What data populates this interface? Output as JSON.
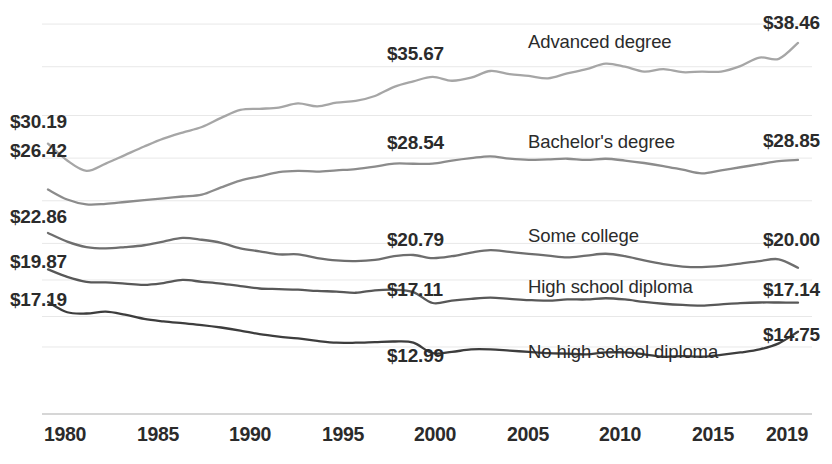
{
  "chart_data": {
    "type": "line",
    "title": "",
    "subtitle": "",
    "xlabel": "",
    "ylabel": "",
    "grid": true,
    "legend_position": "inline-on-series",
    "x": [
      1980,
      1981,
      1982,
      1983,
      1984,
      1985,
      1986,
      1987,
      1988,
      1989,
      1990,
      1991,
      1992,
      1993,
      1994,
      1995,
      1996,
      1997,
      1998,
      1999,
      2000,
      2001,
      2002,
      2003,
      2004,
      2005,
      2006,
      2007,
      2008,
      2009,
      2010,
      2011,
      2012,
      2013,
      2014,
      2015,
      2016,
      2017,
      2018,
      2019
    ],
    "xlim": [
      1980,
      2019
    ],
    "ylim": [
      8.0,
      40.5
    ],
    "xticks": [
      1980,
      1985,
      1990,
      1995,
      2000,
      2005,
      2010,
      2015,
      2019
    ],
    "xtick_labels": [
      "1980",
      "1985",
      "1990",
      "1995",
      "2000",
      "2005",
      "2010",
      "2015",
      "2019"
    ],
    "ygridlines": [
      40.0,
      36.5,
      32.5,
      29.0,
      25.5,
      22.0,
      19.0,
      16.0,
      13.5
    ],
    "series": [
      {
        "name": "Advanced degree",
        "color": "#a6a6a6",
        "start_label": "$30.19",
        "mid_label": "$35.67",
        "end_label": "$38.46",
        "values": [
          30.19,
          28.8,
          27.95,
          28.55,
          29.25,
          29.95,
          30.6,
          31.1,
          31.55,
          32.3,
          32.95,
          33.05,
          33.15,
          33.5,
          33.25,
          33.55,
          33.7,
          34.1,
          34.85,
          35.3,
          35.67,
          35.35,
          35.6,
          36.15,
          35.9,
          35.75,
          35.55,
          35.95,
          36.3,
          36.75,
          36.5,
          36.1,
          36.3,
          36.05,
          36.1,
          36.1,
          36.55,
          37.25,
          37.15,
          38.46
        ]
      },
      {
        "name": "Bachelor's degree",
        "color": "#8c8c8c",
        "start_label": "$26.42",
        "mid_label": "$28.54",
        "end_label": "$28.85",
        "values": [
          26.42,
          25.6,
          25.2,
          25.25,
          25.4,
          25.55,
          25.7,
          25.85,
          26.0,
          26.6,
          27.15,
          27.5,
          27.85,
          27.95,
          27.9,
          28.0,
          28.1,
          28.3,
          28.55,
          28.54,
          28.55,
          28.8,
          29.0,
          29.15,
          28.95,
          28.85,
          28.9,
          28.95,
          28.85,
          28.95,
          28.8,
          28.6,
          28.35,
          28.05,
          27.75,
          28.0,
          28.25,
          28.5,
          28.75,
          28.85
        ]
      },
      {
        "name": "Some college",
        "color": "#6e6e6e",
        "start_label": "$22.86",
        "mid_label": "$20.79",
        "end_label": "$20.00",
        "values": [
          22.86,
          22.15,
          21.7,
          21.6,
          21.7,
          21.85,
          22.15,
          22.45,
          22.3,
          22.05,
          21.6,
          21.35,
          21.1,
          21.1,
          20.8,
          20.6,
          20.55,
          20.65,
          20.95,
          21.05,
          20.79,
          20.95,
          21.25,
          21.45,
          21.3,
          21.15,
          21.0,
          20.85,
          21.0,
          21.15,
          20.95,
          20.6,
          20.3,
          20.1,
          20.05,
          20.15,
          20.35,
          20.55,
          20.7,
          20.0
        ]
      },
      {
        "name": "High school diploma",
        "color": "#585858",
        "start_label": "$19.87",
        "mid_label": "$17.11",
        "end_label": "$17.14",
        "values": [
          19.87,
          19.25,
          18.85,
          18.8,
          18.7,
          18.6,
          18.75,
          19.0,
          18.85,
          18.7,
          18.5,
          18.3,
          18.25,
          18.2,
          18.1,
          18.05,
          17.95,
          18.15,
          18.2,
          18.0,
          17.11,
          17.3,
          17.45,
          17.55,
          17.45,
          17.35,
          17.3,
          17.4,
          17.4,
          17.5,
          17.4,
          17.2,
          17.05,
          16.95,
          16.9,
          17.0,
          17.1,
          17.15,
          17.15,
          17.14
        ]
      },
      {
        "name": "No high school diploma",
        "color": "#3d3d3d",
        "start_label": "$17.19",
        "mid_label": "$12.99",
        "end_label": "$14.75",
        "values": [
          17.19,
          16.35,
          16.25,
          16.4,
          16.15,
          15.8,
          15.6,
          15.45,
          15.3,
          15.1,
          14.85,
          14.55,
          14.35,
          14.2,
          14.0,
          13.85,
          13.85,
          13.9,
          13.95,
          13.85,
          12.99,
          13.1,
          13.3,
          13.3,
          13.2,
          13.1,
          13.0,
          12.95,
          12.9,
          13.05,
          13.05,
          12.9,
          12.7,
          12.75,
          12.7,
          12.85,
          13.05,
          13.3,
          13.8,
          14.75
        ]
      }
    ]
  },
  "labels": {
    "left": [
      {
        "text": "$30.19",
        "x": 10,
        "y": 111
      },
      {
        "text": "$26.42",
        "x": 10,
        "y": 140
      },
      {
        "text": "$22.86",
        "x": 10,
        "y": 206
      },
      {
        "text": "$19.87",
        "x": 10,
        "y": 251
      },
      {
        "text": "$17.19",
        "x": 10,
        "y": 289
      }
    ],
    "mid": [
      {
        "text": "$35.67",
        "x": 387,
        "y": 43
      },
      {
        "text": "$28.54",
        "x": 387,
        "y": 132
      },
      {
        "text": "$20.79",
        "x": 387,
        "y": 229
      },
      {
        "text": "$17.11",
        "x": 387,
        "y": 279
      },
      {
        "text": "$12.99",
        "x": 387,
        "y": 345
      }
    ],
    "right": [
      {
        "text": "$38.46",
        "x": 763,
        "y": 12
      },
      {
        "text": "$28.85",
        "x": 763,
        "y": 130
      },
      {
        "text": "$20.00",
        "x": 763,
        "y": 229
      },
      {
        "text": "$17.14",
        "x": 763,
        "y": 279
      },
      {
        "text": "$14.75",
        "x": 763,
        "y": 324
      }
    ],
    "series_names": [
      {
        "text": "Advanced degree",
        "x": 528,
        "y": 31
      },
      {
        "text": "Bachelor's degree",
        "x": 528,
        "y": 131
      },
      {
        "text": "Some college",
        "x": 528,
        "y": 225
      },
      {
        "text": "High school diploma",
        "x": 528,
        "y": 276
      },
      {
        "text": "No high school diploma",
        "x": 528,
        "y": 341
      }
    ]
  },
  "axis": {
    "xticks": [
      {
        "text": "1980",
        "x": 65
      },
      {
        "text": "1985",
        "x": 158
      },
      {
        "text": "1990",
        "x": 250
      },
      {
        "text": "1995",
        "x": 343
      },
      {
        "text": "2000",
        "x": 435
      },
      {
        "text": "2005",
        "x": 528
      },
      {
        "text": "2010",
        "x": 620
      },
      {
        "text": "2015",
        "x": 713
      },
      {
        "text": "2019",
        "x": 787
      }
    ],
    "y": 423
  },
  "colors": {
    "grid": "#e8e8e8",
    "axis": "#c9c9c9",
    "text": "#2b2b2b",
    "background": "#ffffff"
  }
}
